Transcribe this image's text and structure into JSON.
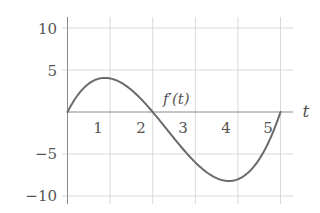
{
  "chart_data": {
    "type": "line",
    "title": "",
    "xlabel": "t",
    "ylabel": "",
    "xlim": [
      0,
      5.25
    ],
    "ylim": [
      -10,
      10
    ],
    "grid": true,
    "x_ticks": [
      1,
      2,
      3,
      4,
      5
    ],
    "x_tick_labels": [
      "1",
      "2",
      "3",
      "4",
      "5"
    ],
    "y_ticks": [
      10,
      5,
      -5,
      -10
    ],
    "y_tick_labels": [
      "10",
      "5",
      "−5",
      "−10"
    ],
    "series": [
      {
        "name": "f′(t)",
        "formula": "t(t-2)(t-5)",
        "x": [
          0,
          0.25,
          0.5,
          0.75,
          0.88,
          1,
          1.25,
          1.5,
          1.75,
          2,
          2.25,
          2.5,
          2.75,
          3,
          3.25,
          3.5,
          3.79,
          4,
          4.25,
          4.5,
          4.75,
          5
        ],
        "values": [
          0,
          2.58,
          3.38,
          3.2,
          4.06,
          4.0,
          3.52,
          2.63,
          1.42,
          0,
          -1.55,
          -3.13,
          -4.64,
          -6.0,
          -7.11,
          -7.88,
          -8.21,
          -8.0,
          -7.44,
          -5.63,
          -3.27,
          0
        ]
      }
    ],
    "annotations": [
      {
        "text": "f′(t)",
        "x": 2.25,
        "y": 1.2
      }
    ]
  },
  "labels": {
    "x_axis": "t",
    "curve": "f′(t)",
    "x_ticks": [
      "1",
      "2",
      "3",
      "4",
      "5"
    ],
    "y_ticks": [
      "10",
      "5",
      "−5",
      "−10"
    ]
  }
}
